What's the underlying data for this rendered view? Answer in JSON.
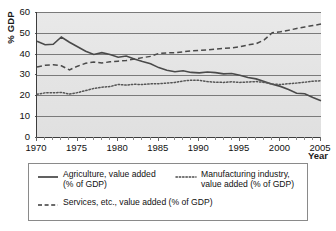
{
  "chart_data": {
    "type": "line",
    "title": "",
    "xlabel": "Year",
    "ylabel": "% GDP",
    "xlim": [
      1970,
      2005
    ],
    "ylim": [
      0,
      60
    ],
    "ytick_values": [
      0,
      10,
      20,
      30,
      40,
      50,
      60
    ],
    "xtick_values": [
      1970,
      1975,
      1980,
      1985,
      1990,
      1995,
      2000,
      2005
    ],
    "xtick_labels": [
      "1970",
      "1975",
      "1980",
      "1985",
      "1990",
      "1995",
      "2000",
      "2005"
    ],
    "ytick_labels": [
      "0",
      "10",
      "20",
      "30",
      "40",
      "50",
      "60"
    ],
    "grid": "horizontal",
    "legend_position": "below",
    "x": [
      1970,
      1971,
      1972,
      1973,
      1974,
      1975,
      1976,
      1977,
      1978,
      1979,
      1980,
      1981,
      1982,
      1983,
      1984,
      1985,
      1986,
      1987,
      1988,
      1989,
      1990,
      1991,
      1992,
      1993,
      1994,
      1995,
      1996,
      1997,
      1998,
      1999,
      2000,
      2001,
      2002,
      2003,
      2004,
      2005
    ],
    "series": [
      {
        "name": "Agriculture, value added (% of GDP)",
        "style": "solid",
        "color": "#4a4a4a",
        "values": [
          46.0,
          44.3,
          44.5,
          48.0,
          45.5,
          43.3,
          41.2,
          39.6,
          40.5,
          39.6,
          38.3,
          38.9,
          37.4,
          36.2,
          35.2,
          33.3,
          32.0,
          31.3,
          31.8,
          31.0,
          30.8,
          31.2,
          30.9,
          30.3,
          30.5,
          29.6,
          28.6,
          27.9,
          26.6,
          25.3,
          24.3,
          22.8,
          21.0,
          20.8,
          19.0,
          17.4
        ]
      },
      {
        "name": "Manufacturing industry, value added (% of GDP)",
        "style": "dotted",
        "color": "#555555",
        "values": [
          20.5,
          21.2,
          21.2,
          21.4,
          20.6,
          21.3,
          22.3,
          23.3,
          23.9,
          24.2,
          25.2,
          24.9,
          25.3,
          25.2,
          25.5,
          25.6,
          25.9,
          26.2,
          26.9,
          27.3,
          27.2,
          26.6,
          26.3,
          26.2,
          26.5,
          26.2,
          26.4,
          26.6,
          26.2,
          25.4,
          25.2,
          25.6,
          25.9,
          26.3,
          26.8,
          27.0
        ]
      },
      {
        "name": "Services, etc., value added (% of GDP)",
        "style": "dashed",
        "color": "#4a4a4a",
        "values": [
          33.6,
          34.4,
          34.7,
          34.2,
          32.2,
          34.0,
          35.4,
          36.0,
          35.5,
          36.1,
          36.4,
          36.7,
          37.4,
          38.1,
          38.7,
          40.1,
          40.4,
          40.5,
          40.9,
          41.3,
          41.6,
          41.8,
          42.2,
          42.5,
          42.8,
          43.3,
          44.2,
          44.8,
          46.6,
          50.1,
          50.5,
          51.2,
          52.1,
          52.8,
          53.5,
          54.2
        ]
      }
    ]
  },
  "axes": {
    "ylabel": "% GDP",
    "xlabel": "Year"
  },
  "legend": {
    "entries": [
      {
        "key_icon": "solid-line-icon",
        "line1": "Agriculture, value added",
        "line2": "(% of GDP)"
      },
      {
        "key_icon": "dotted-line-icon",
        "line1": "Manufacturing industry,",
        "line2": "value added (% of GDP)"
      },
      {
        "key_icon": "dashed-line-icon",
        "line1": "Services, etc., value added (% of GDP)",
        "line2": ""
      }
    ]
  },
  "colors": {
    "plot_background": "#e6e6e6",
    "gridline": "#7a7a7a",
    "axis": "#3d3d3d",
    "series_line": "#4a4a4a",
    "page_background": "#ffffff"
  }
}
